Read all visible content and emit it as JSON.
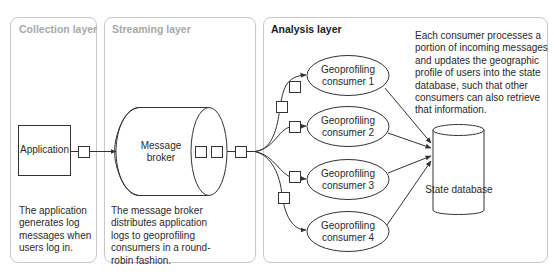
{
  "layers": [
    {
      "id": "collection",
      "title": "Collection layer",
      "description": "The application generates log messages when users log in.",
      "description_lines": [
        "The application",
        "generates log",
        "messages when",
        "users log in."
      ]
    },
    {
      "id": "streaming",
      "title": "Streaming layer",
      "description": "The message broker distributes application logs to geoprofiling consumers in a round-robin fashion.",
      "description_lines": [
        "The message broker",
        "distributes application",
        "logs to geoprofiling",
        "consumers in a round-",
        "robin fashion."
      ]
    },
    {
      "id": "analysis",
      "title": "Analysis layer",
      "description": "Each consumer processes a portion of incoming messages and updates the geographic profile of users into the state database, such that other consumers can also retrieve that information.",
      "description_lines": [
        "Each consumer processes a",
        "portion of incoming messages",
        "and updates the geographic",
        "profile of users into the state",
        "database, such that other",
        "consumers can also retrieve",
        "that information."
      ]
    }
  ],
  "nodes": {
    "application": "Application",
    "broker": {
      "line1": "Message",
      "line2": "broker"
    },
    "consumers": [
      {
        "line1": "Geoprofiling",
        "line2": "consumer 1"
      },
      {
        "line1": "Geoprofiling",
        "line2": "consumer 2"
      },
      {
        "line1": "Geoprofiling",
        "line2": "consumer 3"
      },
      {
        "line1": "Geoprofiling",
        "line2": "consumer 4"
      }
    ],
    "database": "State database"
  },
  "edges": [
    {
      "from": "application",
      "to": "broker",
      "messages": 1
    },
    {
      "from": "broker",
      "to": "consumers",
      "messages": 1,
      "fan_out": 4
    },
    {
      "from": "consumer 1",
      "to": "database"
    },
    {
      "from": "consumer 2",
      "to": "database"
    },
    {
      "from": "consumer 3",
      "to": "database"
    },
    {
      "from": "consumer 4",
      "to": "database"
    }
  ],
  "colors": {
    "panel_border": "#c8c8c8",
    "muted_title": "#a8a8a8",
    "line": "#333333"
  }
}
